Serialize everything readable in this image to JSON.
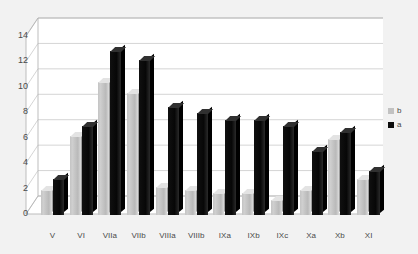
{
  "chart_data": {
    "type": "bar",
    "title": "",
    "subtitle": "",
    "xlabel": "",
    "ylabel": "",
    "ylim": [
      0,
      14
    ],
    "ytick_step": 2,
    "yticks": [
      14,
      12,
      10,
      8,
      6,
      4,
      2,
      0
    ],
    "grid": true,
    "grid_axis": "y",
    "three_d": true,
    "legend_position": "right",
    "categories": [
      "V",
      "VI",
      "VIIa",
      "VIIb",
      "VIIIa",
      "VIIIb",
      "IXa",
      "IXb",
      "IXc",
      "Xa",
      "Xb",
      "XI"
    ],
    "series": [
      {
        "name": "b",
        "color": "#c4c4c4",
        "values": [
          2.0,
          6.2,
          10.5,
          9.6,
          2.2,
          2.0,
          1.7,
          1.7,
          1.2,
          2.0,
          6.0,
          2.8
        ]
      },
      {
        "name": "a",
        "color": "#0c0c0c",
        "values": [
          2.8,
          7.0,
          12.9,
          12.2,
          8.5,
          8.0,
          7.5,
          7.5,
          7.0,
          5.0,
          6.5,
          3.5
        ]
      }
    ]
  },
  "legend": {
    "entries": [
      {
        "label": "b",
        "swatch": "b"
      },
      {
        "label": "a",
        "swatch": "a"
      }
    ]
  },
  "colors": {
    "background": "#f2f2f2",
    "plot_background": "#ffffff",
    "gridline": "#c9c9c9",
    "axis_text": "#4a4a4a",
    "series_b": "#c4c4c4",
    "series_a": "#0c0c0c"
  }
}
